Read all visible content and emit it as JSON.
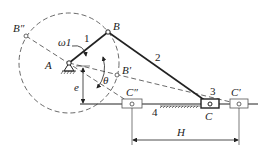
{
  "diagram": {
    "type": "offset slider-crank mechanism",
    "labels": {
      "B_double_prime": "B″",
      "B": "B",
      "B_prime": "B′",
      "A": "A",
      "omega1": "ω1",
      "theta": "θ",
      "e": "e",
      "C_double_prime": "C″",
      "C": "C",
      "C_prime": "C′",
      "H": "H"
    },
    "link_numbers": {
      "crank": "1",
      "coupler": "2",
      "slider": "3",
      "frame": "4"
    },
    "colors": {
      "line": "#222222",
      "background": "#ffffff"
    }
  }
}
